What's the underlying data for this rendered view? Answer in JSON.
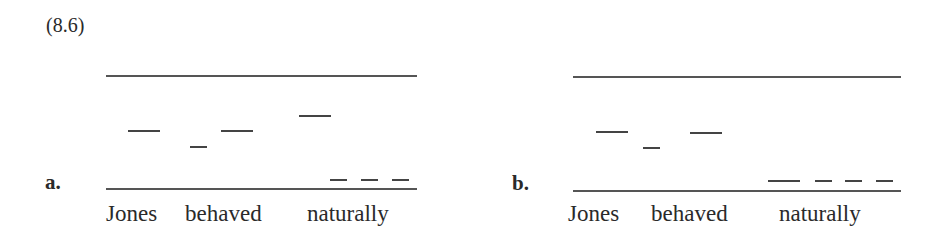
{
  "title": "(8.6)",
  "panels": [
    {
      "label": "a.",
      "words": [
        "Jones",
        "behaved",
        "naturally"
      ]
    },
    {
      "label": "b.",
      "words": [
        "Jones",
        "behaved",
        "naturally"
      ]
    }
  ]
}
